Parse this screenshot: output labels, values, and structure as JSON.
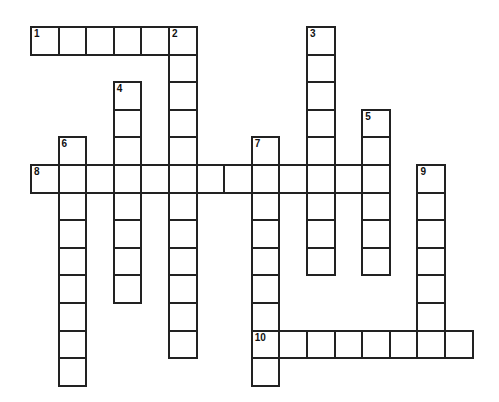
{
  "puzzle": {
    "cell_size": 27.6,
    "origin": {
      "x": 30,
      "y": 26
    },
    "border_color": "#222222",
    "entries": [
      {
        "number": "1",
        "direction": "across",
        "row": 0,
        "col": 0,
        "length": 6
      },
      {
        "number": "2",
        "direction": "down",
        "row": 0,
        "col": 5,
        "length": 12
      },
      {
        "number": "3",
        "direction": "down",
        "row": 0,
        "col": 10,
        "length": 9
      },
      {
        "number": "4",
        "direction": "down",
        "row": 2,
        "col": 3,
        "length": 8
      },
      {
        "number": "5",
        "direction": "down",
        "row": 3,
        "col": 12,
        "length": 6
      },
      {
        "number": "6",
        "direction": "down",
        "row": 4,
        "col": 1,
        "length": 9
      },
      {
        "number": "7",
        "direction": "down",
        "row": 4,
        "col": 8,
        "length": 9
      },
      {
        "number": "8",
        "direction": "across",
        "row": 5,
        "col": 0,
        "length": 13
      },
      {
        "number": "9",
        "direction": "down",
        "row": 5,
        "col": 14,
        "length": 7
      },
      {
        "number": "10",
        "direction": "across",
        "row": 11,
        "col": 8,
        "length": 8
      }
    ]
  }
}
